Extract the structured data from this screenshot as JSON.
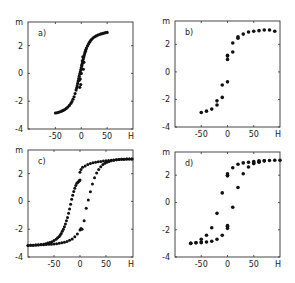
{
  "figure": {
    "background": "#ffffff",
    "ink": "#111111",
    "frame_color": "#333333"
  },
  "chart_data": [
    {
      "id": "a",
      "type": "scatter",
      "panel_label": "a)",
      "xlabel": "H",
      "ylabel": "m",
      "xlim": [
        -103,
        100
      ],
      "ylim": [
        -4,
        3.7
      ],
      "xticks": [
        -50,
        0,
        50
      ],
      "xtick_labels": [
        "-50",
        "0",
        "50"
      ],
      "yticks": [
        -4,
        -2,
        0,
        2
      ],
      "ytick_labels": [
        "-4",
        "-2",
        "0",
        "2"
      ],
      "grid": false,
      "legend": null,
      "frame": {
        "x": 28,
        "y": 22,
        "w": 105,
        "h": 107
      },
      "marker_size": 1.6,
      "series": [
        {
          "name": "dense curve",
          "x": [
            -50,
            -47,
            -44,
            -41,
            -38,
            -35,
            -32,
            -29,
            -26,
            -23,
            -20,
            -18,
            -16,
            -14,
            -12,
            -10,
            -9,
            -8,
            -7,
            -6,
            -5,
            -4,
            -3,
            -2,
            -1,
            0,
            1,
            2,
            3,
            4,
            5,
            6,
            7,
            8,
            9,
            10,
            12,
            14,
            16,
            18,
            20,
            23,
            26,
            29,
            32,
            35,
            38,
            41,
            44,
            47,
            50,
            -2,
            0,
            2,
            -1,
            1,
            3,
            -3,
            4,
            -4,
            5
          ],
          "y": [
            -2.85,
            -2.83,
            -2.8,
            -2.76,
            -2.72,
            -2.66,
            -2.6,
            -2.52,
            -2.42,
            -2.3,
            -2.15,
            -2.02,
            -1.86,
            -1.68,
            -1.45,
            -1.2,
            -1.05,
            -0.9,
            -0.72,
            -0.55,
            -0.38,
            -0.2,
            -0.05,
            0.1,
            0.25,
            0.4,
            0.55,
            0.72,
            0.9,
            1.05,
            1.2,
            1.35,
            1.48,
            1.6,
            1.72,
            1.82,
            1.98,
            2.12,
            2.25,
            2.36,
            2.45,
            2.56,
            2.64,
            2.7,
            2.76,
            2.8,
            2.84,
            2.87,
            2.9,
            2.93,
            2.95,
            -0.4,
            0.0,
            0.9,
            -0.8,
            0.6,
            1.2,
            -1.0,
            0.3,
            -0.5,
            0.8
          ]
        }
      ]
    },
    {
      "id": "b",
      "type": "scatter",
      "panel_label": "b)",
      "xlabel": "H",
      "ylabel": "m",
      "xlim": [
        -100,
        100
      ],
      "ylim": [
        -4,
        3.7
      ],
      "xticks": [
        -50,
        0,
        50
      ],
      "xtick_labels": [
        "-50",
        "0",
        "50"
      ],
      "yticks": [
        -4,
        -2,
        0,
        2
      ],
      "ytick_labels": [
        "-4",
        "-2",
        "0",
        "2"
      ],
      "grid": false,
      "legend": null,
      "frame": {
        "x": 175,
        "y": 21,
        "w": 105,
        "h": 106
      },
      "marker_size": 1.8,
      "series": [
        {
          "name": "data points",
          "x": [
            -50,
            -40,
            -30,
            -20,
            -20,
            -10,
            -10,
            0,
            0,
            0,
            0,
            10,
            10,
            20,
            20,
            30,
            40,
            50,
            60,
            70,
            80,
            90
          ],
          "y": [
            -2.95,
            -2.85,
            -2.7,
            -2.4,
            -2.1,
            -1.85,
            -0.95,
            -0.72,
            0.9,
            1.2,
            1.15,
            1.45,
            2.1,
            2.45,
            2.55,
            2.75,
            2.9,
            2.95,
            3.0,
            3.05,
            3.05,
            2.95
          ]
        }
      ]
    },
    {
      "id": "c",
      "type": "scatter",
      "panel_label": "c)",
      "xlabel": "H",
      "ylabel": "m",
      "xlim": [
        -100,
        102
      ],
      "ylim": [
        -4,
        3.7
      ],
      "xticks": [
        -50,
        0,
        50
      ],
      "xtick_labels": [
        "-50",
        "0",
        "50"
      ],
      "yticks": [
        -4,
        -2,
        0,
        2
      ],
      "ytick_labels": [
        "-4",
        "-2",
        "0",
        "2"
      ],
      "grid": false,
      "legend": null,
      "frame": {
        "x": 28,
        "y": 150,
        "w": 105,
        "h": 107
      },
      "marker_size": 1.5,
      "series": [
        {
          "name": "descending branch",
          "x": [
            100,
            95,
            90,
            85,
            80,
            75,
            70,
            65,
            60,
            55,
            50,
            45,
            40,
            35,
            30,
            25,
            20,
            15,
            10,
            5,
            2,
            0,
            0,
            -1,
            -2,
            -4,
            -6,
            -8,
            -10,
            -12,
            -14,
            -16,
            -18,
            -20,
            -22,
            -24,
            -26,
            -28,
            -30,
            -32,
            -34,
            -36,
            -38,
            -40,
            -43,
            -46,
            -50,
            -54,
            -58,
            -62,
            -66,
            -70,
            -75,
            -80,
            -85,
            -90,
            -95,
            -100
          ],
          "y": [
            3.05,
            3.05,
            3.05,
            3.04,
            3.03,
            3.02,
            3.0,
            2.98,
            2.96,
            2.94,
            2.92,
            2.9,
            2.88,
            2.85,
            2.82,
            2.78,
            2.73,
            2.65,
            2.55,
            2.45,
            2.3,
            2.1,
            1.55,
            1.5,
            1.45,
            1.38,
            1.3,
            1.15,
            0.95,
            0.72,
            0.45,
            0.15,
            -0.2,
            -0.55,
            -0.85,
            -1.15,
            -1.4,
            -1.62,
            -1.82,
            -2.0,
            -2.15,
            -2.3,
            -2.42,
            -2.52,
            -2.62,
            -2.72,
            -2.82,
            -2.9,
            -2.96,
            -3.0,
            -3.04,
            -3.08,
            -3.1,
            -3.12,
            -3.14,
            -3.15,
            -3.16,
            -3.17
          ]
        },
        {
          "name": "ascending branch",
          "x": [
            -100,
            -95,
            -90,
            -85,
            -80,
            -75,
            -70,
            -65,
            -60,
            -55,
            -50,
            -45,
            -40,
            -35,
            -30,
            -25,
            -20,
            -15,
            -10,
            -5,
            0,
            2,
            4,
            8,
            12,
            16,
            20,
            24,
            28,
            32,
            36,
            40,
            44,
            48,
            52,
            56,
            60,
            65,
            70,
            75,
            80,
            85,
            90,
            95,
            100
          ],
          "y": [
            -3.17,
            -3.16,
            -3.15,
            -3.14,
            -3.13,
            -3.12,
            -3.11,
            -3.1,
            -3.09,
            -3.08,
            -3.06,
            -3.04,
            -3.01,
            -2.98,
            -2.94,
            -2.88,
            -2.8,
            -2.7,
            -2.55,
            -2.35,
            -2.05,
            -1.95,
            -2.0,
            -1.4,
            -0.5,
            0.1,
            0.7,
            1.25,
            1.7,
            2.05,
            2.3,
            2.5,
            2.65,
            2.75,
            2.82,
            2.88,
            2.92,
            2.96,
            2.99,
            3.01,
            3.03,
            3.04,
            3.05,
            3.05,
            3.05
          ]
        }
      ]
    },
    {
      "id": "d",
      "type": "scatter",
      "panel_label": "d)",
      "xlabel": "H",
      "ylabel": "m",
      "xlim": [
        -100,
        100
      ],
      "ylim": [
        -4,
        3.7
      ],
      "xticks": [
        -50,
        0,
        50
      ],
      "xtick_labels": [
        "-50",
        "0",
        "50"
      ],
      "yticks": [
        -4,
        -2,
        0,
        2
      ],
      "ytick_labels": [
        "-4",
        "-2",
        "0",
        "2"
      ],
      "grid": false,
      "legend": null,
      "frame": {
        "x": 175,
        "y": 152,
        "w": 105,
        "h": 105
      },
      "marker_size": 1.8,
      "series": [
        {
          "name": "descending branch",
          "x": [
            100,
            90,
            80,
            70,
            60,
            60,
            50,
            50,
            40,
            30,
            20,
            10,
            0,
            0,
            0,
            -10,
            -20,
            -30,
            -40,
            -50,
            -50,
            -60,
            -70
          ],
          "y": [
            3.1,
            3.1,
            3.08,
            3.05,
            3.05,
            2.95,
            3.0,
            2.9,
            2.95,
            2.9,
            2.8,
            2.55,
            2.1,
            2.0,
            1.95,
            0.7,
            -0.8,
            -1.85,
            -2.4,
            -2.7,
            -2.9,
            -2.95,
            -3.0
          ],
          "note": "upper/left points"
        },
        {
          "name": "ascending branch",
          "x": [
            -70,
            -60,
            -50,
            -40,
            -30,
            -20,
            -10,
            0,
            0,
            0,
            10,
            20,
            30,
            40,
            50,
            60,
            70
          ],
          "y": [
            -3.0,
            -2.95,
            -2.95,
            -2.9,
            -2.85,
            -2.7,
            -2.4,
            -1.9,
            -1.75,
            -1.7,
            -0.35,
            1.1,
            2.1,
            2.6,
            2.85,
            3.0,
            3.05
          ]
        }
      ]
    }
  ]
}
